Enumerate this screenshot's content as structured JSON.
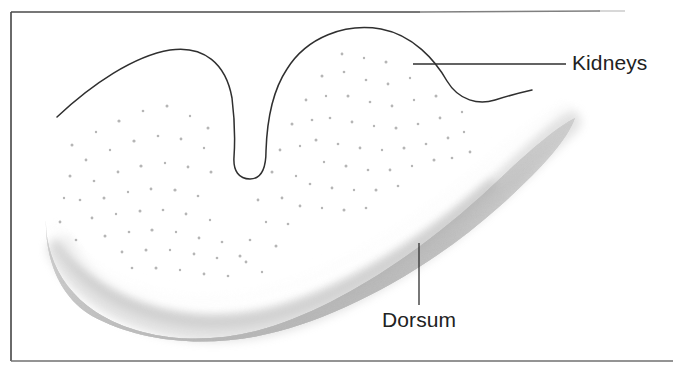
{
  "figure": {
    "kind": "anatomical-illustration",
    "background_color": "#ffffff",
    "frame": {
      "name": "figure-border",
      "stroke_color": "#3a3a3a",
      "top_faded_right_edge": true
    },
    "labels": [
      {
        "id": "kidneys",
        "text": "Kidneys",
        "x": 572,
        "y": 70,
        "anchor": "start",
        "leader": {
          "type": "horizontal-line",
          "x1": 413,
          "y1": 64,
          "x2": 566,
          "y2": 64
        }
      },
      {
        "id": "dorsum",
        "text": "Dorsum",
        "x": 382,
        "y": 327,
        "anchor": "start",
        "leader": {
          "type": "vertical-line",
          "x1": 419,
          "y1": 243,
          "x2": 419,
          "y2": 305
        }
      }
    ],
    "organ": {
      "name": "kidneys-outline",
      "stroke_color": "#333333",
      "fill_color": "#ffffff",
      "texture": "stipple-dots",
      "texture_color": "#b9b9b9"
    },
    "dorsum_band": {
      "name": "dorsum-shading",
      "style": "airbrush-gradient",
      "light_color": "#f7f7f7",
      "mid_color": "#d3d3d3",
      "dark_color": "#a9a9a9"
    }
  }
}
